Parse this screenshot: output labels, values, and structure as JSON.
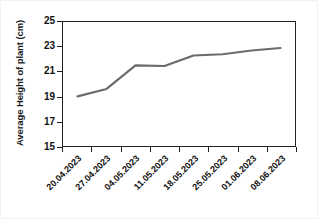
{
  "chart_data": {
    "type": "line",
    "title": "",
    "subtitle": "",
    "xlabel": "",
    "ylabel": "Average Height of plant (cm)",
    "categories": [
      "20.04.2023",
      "27.04.2023",
      "04.05.2023",
      "11.05.2023",
      "18.05.2023",
      "25.05.2023",
      "01.06.2023",
      "08.06.2023"
    ],
    "values": [
      19.0,
      19.6,
      21.5,
      21.45,
      22.3,
      22.4,
      22.7,
      22.9
    ],
    "series": [
      {
        "name": "Average Height of plant",
        "values": [
          19.0,
          19.6,
          21.5,
          21.45,
          22.3,
          22.4,
          22.7,
          22.9
        ],
        "color": "#6b6b6b",
        "marker": "none",
        "line_width": 2
      }
    ],
    "ylim": [
      15,
      25
    ],
    "yticks": [
      15,
      17,
      19,
      21,
      23,
      25
    ],
    "ytick_labels": [
      "15",
      "17",
      "19",
      "21",
      "23",
      "25"
    ],
    "grid": false,
    "legend": false,
    "legend_position": "none",
    "frame": true,
    "tick_direction": "out",
    "xtick_label_rotation": -45,
    "background_color": "#ffffff",
    "axis_color": "#1f1f1f"
  }
}
